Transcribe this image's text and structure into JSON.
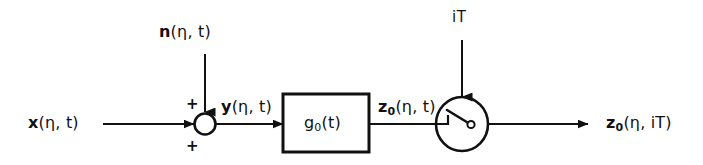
{
  "diagram": {
    "background_color": "#ffffff",
    "stroke_color": "#111111",
    "signals": {
      "input": {
        "symbol": "x",
        "args": "(η, t)",
        "subscript": ""
      },
      "noise": {
        "symbol": "n",
        "args": "(η, t)",
        "subscript": ""
      },
      "sum_output": {
        "symbol": "y",
        "args": "(η, t)",
        "subscript": ""
      },
      "filter_output": {
        "symbol": "z",
        "subscript": "0",
        "args": "(η, t)"
      },
      "sampled_output": {
        "symbol": "z",
        "subscript": "0",
        "args": "(η, iT)"
      }
    },
    "blocks": {
      "filter": {
        "symbol": "g",
        "subscript": "0",
        "args": "(t)"
      },
      "summing_junction": {
        "sign_top": "+",
        "sign_bottom": "+"
      },
      "sampler": {
        "clock_label": "iT"
      }
    }
  }
}
